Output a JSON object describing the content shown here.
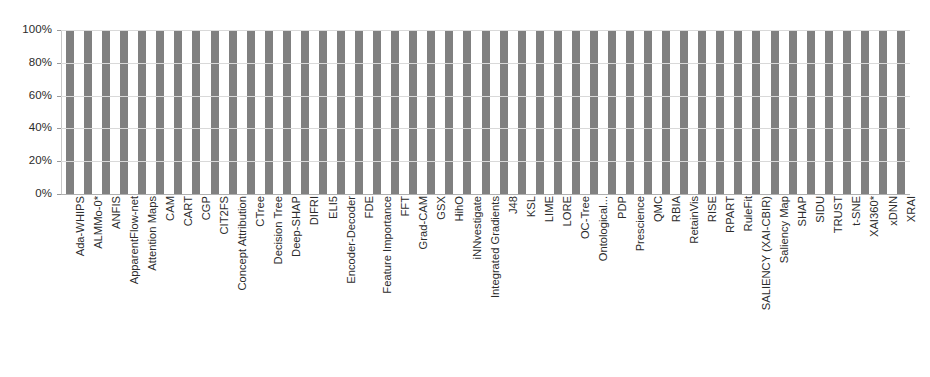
{
  "chart_data": {
    "type": "bar",
    "title": "",
    "subtitle": "",
    "xlabel": "",
    "ylabel": "",
    "ylim": [
      0,
      100
    ],
    "grid": true,
    "legend": false,
    "bar_color": "#808080",
    "gridline_color": "#d9d9d9",
    "axis_color": "#b0b0b0",
    "y_ticks": [
      "0%",
      "20%",
      "40%",
      "60%",
      "80%",
      "100%"
    ],
    "y_tick_values": [
      0,
      20,
      40,
      60,
      80,
      100
    ],
    "value_unit": "%",
    "categories": [
      "Ada-WHIPS",
      "ALMMo-0*",
      "ANFIS",
      "ApparentFlow-net",
      "Attention Maps",
      "CAM",
      "CART",
      "CGP",
      "CIT2FS",
      "Concept Attribution",
      "CTree",
      "Decision Tree",
      "Deep-SHAP",
      "DIFRI",
      "ELI5",
      "Encoder-Decoder",
      "FDE",
      "Feature Importance",
      "FFT",
      "Grad-CAM",
      "GSX",
      "HihO",
      "iNNvestigate",
      "Integrated Gradients",
      "J48",
      "KSL",
      "LIME",
      "LORE",
      "OC-Tree",
      "Ontological...",
      "PDP",
      "Prescience",
      "QMC",
      "RBIA",
      "RetainVis",
      "RISE",
      "RPART",
      "RuleFit",
      "SALIENCY (XAI-CBIR)",
      "Saliency Map",
      "SHAP",
      "SIDU",
      "TRUST",
      "t-SNE",
      "XAI360*",
      "xDNN",
      "XRAI"
    ],
    "values": [
      100,
      100,
      100,
      100,
      100,
      100,
      100,
      100,
      100,
      100,
      100,
      100,
      100,
      100,
      100,
      100,
      100,
      100,
      100,
      100,
      100,
      100,
      100,
      100,
      100,
      100,
      100,
      100,
      100,
      100,
      100,
      100,
      100,
      100,
      100,
      100,
      100,
      100,
      100,
      100,
      100,
      100,
      100,
      100,
      100,
      100,
      100
    ]
  }
}
